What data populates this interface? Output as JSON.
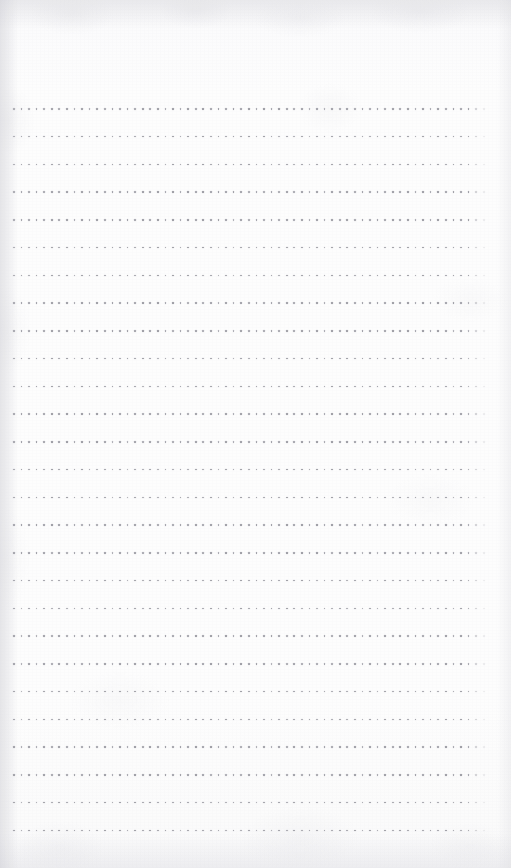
{
  "page": {
    "kind": "scanned-dot-grid-notebook-page",
    "width": 511,
    "height": 868,
    "background_color": "#fcfcfc",
    "paper_tint": "#fdfdfd",
    "has_text": false,
    "has_handwriting": false,
    "visible_text": ""
  },
  "dot_grid": {
    "dot_color": "#9b9ba3",
    "dot_size_px": 1.7,
    "row_count": 27,
    "dots_per_row": 61,
    "first_dot_x": 13,
    "first_row_y": 108,
    "row_spacing_px": 27.75,
    "column_spacing_px": 7.6,
    "last_dot_x": 469,
    "last_row_y": 828,
    "trailing_partial_dot": true,
    "margins": {
      "top_px": 108,
      "bottom_px": 40,
      "left_px": 13,
      "right_px": 41
    }
  },
  "texture": {
    "edge_shadow_color": "#cbcbd2",
    "mottle_color": "#d6d6db",
    "grain_opacity": 0.3,
    "top_edge_darker": true,
    "left_edge_darker": true
  }
}
